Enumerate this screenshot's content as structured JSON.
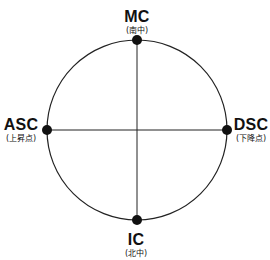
{
  "heading": {
    "text": "",
    "note": "cropped"
  },
  "diagram": {
    "center": {
      "x": 137,
      "y": 130
    },
    "radius": 90,
    "line_color": "#222222",
    "dot_color": "#111111",
    "points": {
      "mc": {
        "label": "MC",
        "sublabel": "(南中)"
      },
      "asc": {
        "label": "ASC",
        "sublabel": "(上昇点)"
      },
      "dsc": {
        "label": "DSC",
        "sublabel": "(下降点)"
      },
      "ic": {
        "label": "IC",
        "sublabel": "(北中)"
      }
    }
  }
}
